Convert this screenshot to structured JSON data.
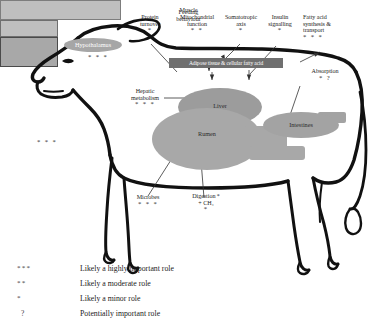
{
  "diagram": {
    "animal": "dairy-cow-outline",
    "top_labels": [
      {
        "text": "Protein turnover",
        "line1": "Protein",
        "line2": "turnover",
        "stars": "*"
      },
      {
        "text": "Mitochondrial function",
        "line1": "Mitochondrial",
        "line2": "function",
        "stars": "* *"
      },
      {
        "text": "Somatotropic axis",
        "line1": "Somatotropic",
        "line2": "axis",
        "stars": "*"
      },
      {
        "text": "Insulin signalling",
        "line1": "Insulin",
        "line2": "signalling",
        "stars": "*"
      },
      {
        "text": "Fatty acid synthesis & transport",
        "line1": "Fatty acid",
        "line2": "synthesis &",
        "line3": "transport",
        "stars": "* * *"
      }
    ],
    "organs": {
      "hypothalamus": {
        "label": "Hypothalamus",
        "stars": "* * *"
      },
      "adipose": {
        "label": "Adipose tissue & cellular fatty acid"
      },
      "muscle": {
        "label": "Muscle"
      },
      "liver": {
        "label": "Liver"
      },
      "rumen": {
        "label": "Rumen"
      },
      "intestines": {
        "label": "Intestines"
      }
    },
    "annotations": {
      "hepatic_metabolism": {
        "line1": "Hepatic",
        "line2": "metabolism",
        "stars": "* * *"
      },
      "absorption": {
        "label": "Absorption",
        "stars": "* ?"
      },
      "feeding_behaviour": {
        "line1": "Feeding",
        "line2": "behaviour",
        "stars": "* * *"
      },
      "microbes": {
        "label": "Microbes",
        "stars": "* * *"
      },
      "digestion": {
        "line1": "Digestion *",
        "line2": "+ CH₄",
        "stars": "*"
      }
    },
    "legend": [
      {
        "symbol": "***",
        "description": "Likely a highly important role"
      },
      {
        "symbol": "**",
        "description": "Likely a moderate role"
      },
      {
        "symbol": "*",
        "description": "Likely a minor role"
      },
      {
        "symbol": "?",
        "description": "Potentially important role"
      }
    ],
    "colors": {
      "background": "#ffffff",
      "outline": "#111111",
      "organ_fill": "#a8a8a8",
      "adipose_fill": "#6f6f6f",
      "muscle_fill": "#bfbfbf",
      "text": "#1a1a1a"
    }
  }
}
